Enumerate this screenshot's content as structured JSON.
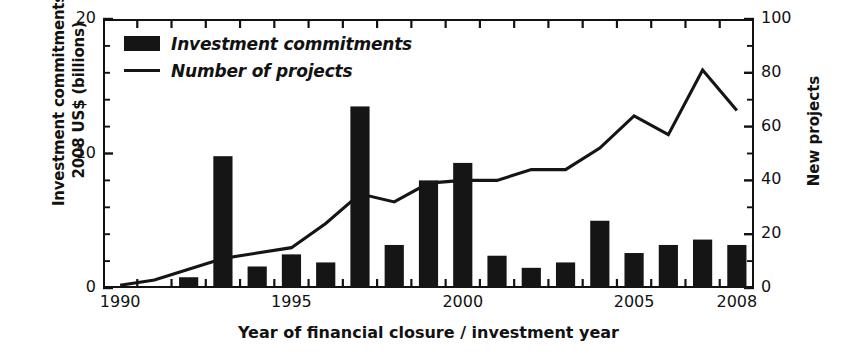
{
  "chart_data": {
    "type": "bar",
    "title": "",
    "subtitle": "",
    "xlabel": "Year of financial closure / investment year",
    "ylabel_left": "Investment commitments 2008 US$ (billions)",
    "ylabel_right": "New projects",
    "grid": false,
    "legend_position": "top-left",
    "categories": [
      1990,
      1991,
      1992,
      1993,
      1994,
      1995,
      1996,
      1997,
      1998,
      1999,
      2000,
      2001,
      2002,
      2003,
      2004,
      2005,
      2006,
      2007,
      2008
    ],
    "x": [
      "1990",
      "1991",
      "1992",
      "1993",
      "1994",
      "1995",
      "1996",
      "1997",
      "1998",
      "1999",
      "2000",
      "2001",
      "2002",
      "2003",
      "2004",
      "2005",
      "2006",
      "2007",
      "2008"
    ],
    "xlim": [
      1989.5,
      2008.5
    ],
    "xticks": [
      "1990",
      "1995",
      "2000",
      "2005",
      "2008"
    ],
    "xtick_values": [
      1990,
      1995,
      2000,
      2005,
      2008
    ],
    "left_axis": {
      "label": "Investment commitments 2008 US$ (billions)",
      "ylim": [
        0,
        20
      ],
      "ticks": [
        0,
        10,
        20
      ],
      "tick_labels": [
        "0",
        "10",
        "20"
      ],
      "minor_tick_step": 2
    },
    "right_axis": {
      "label": "New projects",
      "ylim": [
        0,
        100
      ],
      "ticks": [
        0,
        20,
        40,
        60,
        80,
        100
      ],
      "tick_labels": [
        "0",
        "20",
        "40",
        "60",
        "80",
        "100"
      ],
      "minor_tick_step": 10
    },
    "series": [
      {
        "name": "Investment commitments",
        "kind": "bar",
        "axis": "left",
        "unit": "2008 US$ billions",
        "color": "#151515",
        "values": [
          0.1,
          0.15,
          0.8,
          9.8,
          1.6,
          2.5,
          1.9,
          13.5,
          3.2,
          8.0,
          9.3,
          2.4,
          1.5,
          1.9,
          5.0,
          2.6,
          3.2,
          3.6,
          3.2
        ]
      },
      {
        "name": "Number of projects",
        "kind": "line",
        "axis": "right",
        "unit": "new projects",
        "color": "#151515",
        "values": [
          1,
          3,
          7,
          11,
          13,
          15,
          24,
          35,
          32,
          39,
          40,
          40,
          44,
          44,
          52,
          64,
          57,
          81,
          66
        ]
      }
    ]
  },
  "legend": {
    "items": [
      {
        "label": "Investment commitments",
        "marker": "bar-swatch"
      },
      {
        "label": "Number of projects",
        "marker": "line-swatch"
      }
    ]
  },
  "colors": {
    "ink": "#121212",
    "series": "#151515",
    "background": "#ffffff"
  }
}
